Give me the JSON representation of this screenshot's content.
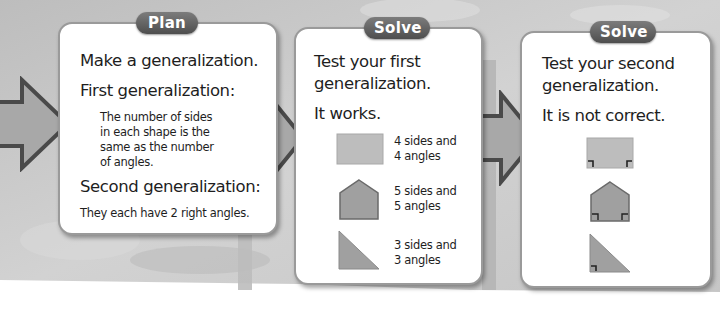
{
  "colors": {
    "background_band": "#c9c9c9",
    "panel_bg": "#ffffff",
    "panel_border": "#9a9a9a",
    "tag_bg": "#5e5e5e",
    "tag_text": "#ffffff",
    "arrow_fill": "#a8a8a8",
    "arrow_stroke": "#4a4a4a",
    "rect_fill": "#bdbdbd",
    "shape_fill": "#a0a0a0",
    "shape_stroke": "#6a6a6a"
  },
  "arrows": [
    {
      "name": "arrow-into-plan",
      "icon": "right-arrow-icon"
    },
    {
      "name": "arrow-plan-to-solve",
      "icon": "right-arrow-icon"
    },
    {
      "name": "arrow-solve-to-solve",
      "icon": "right-arrow-icon"
    }
  ],
  "plan": {
    "tag": "Plan",
    "heading": "Make a generalization.",
    "first_label": "First generalization:",
    "first_text_lines": [
      "The number of sides",
      "in each shape is the",
      "same as the number",
      "of angles."
    ],
    "second_label": "Second generalization:",
    "second_text": "They each have 2 right angles."
  },
  "solve1": {
    "tag": "Solve",
    "heading_lines": [
      "Test your first",
      "generalization."
    ],
    "result": "It works.",
    "shapes": [
      {
        "shape": "rectangle",
        "icon": "rectangle-icon",
        "lines": [
          "4 sides and",
          "4 angles"
        ]
      },
      {
        "shape": "pentagon",
        "icon": "pentagon-icon",
        "lines": [
          "5 sides and",
          "5 angles"
        ]
      },
      {
        "shape": "right-triangle",
        "icon": "triangle-icon",
        "lines": [
          "3 sides and",
          "3 angles"
        ]
      }
    ]
  },
  "solve2": {
    "tag": "Solve",
    "heading_lines": [
      "Test your second",
      "generalization."
    ],
    "result": "It is not correct.",
    "shapes": [
      {
        "shape": "rectangle",
        "icon": "rectangle-right-angles-icon",
        "right_angle_marks": 2
      },
      {
        "shape": "pentagon",
        "icon": "pentagon-right-angles-icon",
        "right_angle_marks": 2
      },
      {
        "shape": "right-triangle",
        "icon": "triangle-right-angle-icon",
        "right_angle_marks": 1
      }
    ]
  }
}
